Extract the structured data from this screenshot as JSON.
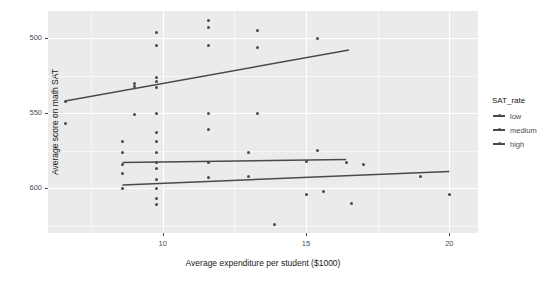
{
  "chart_data": {
    "type": "scatter",
    "title": "",
    "xlabel": "Average expenditure per student ($1000)",
    "ylabel": "Average score on math SAT",
    "xlim": [
      6.0,
      21.0
    ],
    "ylim": [
      470,
      618
    ],
    "xticks": [
      10,
      15,
      20
    ],
    "yticks": [
      500,
      550,
      600
    ],
    "grid": true,
    "legend": {
      "position": "right",
      "title": "SAT_rate",
      "entries": [
        "low",
        "medium",
        "high"
      ]
    },
    "series": [
      {
        "name": "high",
        "points": [
          [
            6.6,
            543
          ],
          [
            6.6,
            558
          ],
          [
            9.0,
            570
          ],
          [
            9.0,
            568
          ],
          [
            9.0,
            549
          ],
          [
            9.8,
            604
          ],
          [
            9.8,
            595
          ],
          [
            9.8,
            574
          ],
          [
            9.8,
            571
          ],
          [
            9.8,
            567
          ],
          [
            9.8,
            550
          ],
          [
            11.6,
            612
          ],
          [
            11.6,
            607
          ],
          [
            11.6,
            595
          ],
          [
            11.6,
            550
          ],
          [
            11.6,
            539
          ],
          [
            13.3,
            605
          ],
          [
            13.3,
            594
          ],
          [
            13.3,
            550
          ],
          [
            15.4,
            600
          ],
          [
            15.4,
            525
          ]
        ],
        "fit_line": [
          [
            6.6,
            558
          ],
          [
            16.5,
            592
          ]
        ]
      },
      {
        "name": "medium",
        "points": [
          [
            8.6,
            531
          ],
          [
            8.6,
            524
          ],
          [
            8.6,
            516
          ],
          [
            9.8,
            537
          ],
          [
            9.8,
            531
          ],
          [
            9.8,
            524
          ],
          [
            9.8,
            517
          ],
          [
            11.6,
            517
          ],
          [
            13.0,
            524
          ],
          [
            15.0,
            518
          ],
          [
            16.4,
            517
          ],
          [
            17.0,
            516
          ]
        ],
        "fit_line": [
          [
            8.6,
            517
          ],
          [
            16.4,
            519
          ]
        ]
      },
      {
        "name": "low",
        "points": [
          [
            8.6,
            510
          ],
          [
            8.6,
            500
          ],
          [
            9.8,
            513
          ],
          [
            9.8,
            506
          ],
          [
            9.8,
            500
          ],
          [
            9.8,
            493
          ],
          [
            9.8,
            489
          ],
          [
            11.6,
            507
          ],
          [
            13.0,
            508
          ],
          [
            15.0,
            496
          ],
          [
            15.6,
            498
          ],
          [
            16.6,
            490
          ],
          [
            19.0,
            508
          ],
          [
            20.0,
            496
          ],
          [
            13.9,
            476
          ]
        ],
        "fit_line": [
          [
            8.6,
            502
          ],
          [
            20.0,
            511
          ]
        ]
      }
    ]
  },
  "axes": {
    "ytick_labels": [
      "600",
      "550",
      "500"
    ],
    "xtick_labels": [
      "10",
      "15",
      "20"
    ],
    "ylabel": "Average score on math SAT",
    "xlabel": "Average expenditure per student ($1000)"
  },
  "legend": {
    "title": "SAT_rate",
    "items": [
      {
        "label": "low",
        "color": "#4a4a4a"
      },
      {
        "label": "medium",
        "color": "#4a4a4a"
      },
      {
        "label": "high",
        "color": "#4a4a4a"
      }
    ]
  },
  "colors": {
    "panel": "#ebebeb",
    "grid_major": "#ffffff",
    "grid_minor": "#f7f7f7",
    "point": "#4a4a4a",
    "line": "#4a4a4a",
    "text": "#4d4d4d"
  }
}
